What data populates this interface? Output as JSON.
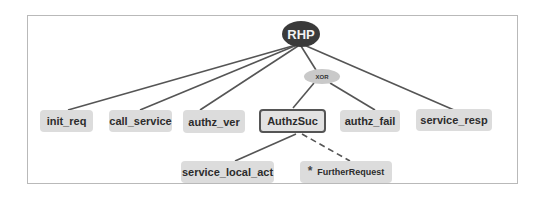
{
  "diagram": {
    "root": {
      "label": "RHP"
    },
    "operator": {
      "label": "XOR"
    },
    "children": [
      {
        "id": "init_req",
        "label": "init_req"
      },
      {
        "id": "call_service",
        "label": "call_service"
      },
      {
        "id": "authz_ver",
        "label": "authz_ver"
      },
      {
        "id": "authzsuc",
        "label": "AuthzSuc",
        "selected": true
      },
      {
        "id": "authz_fail",
        "label": "authz_fail"
      },
      {
        "id": "service_resp",
        "label": "service_resp"
      }
    ],
    "subchildren": [
      {
        "id": "service_local_act",
        "label": "service_local_act"
      },
      {
        "id": "further_request",
        "label": "FurtherRequest",
        "marker": "*",
        "optional": true
      }
    ],
    "colors": {
      "root_fill": "#3a3a3a",
      "xor_fill": "#c9c9c9",
      "node_fill": "#dcdcdc",
      "edge": "#555555",
      "frame": "#b9b9b9"
    }
  }
}
